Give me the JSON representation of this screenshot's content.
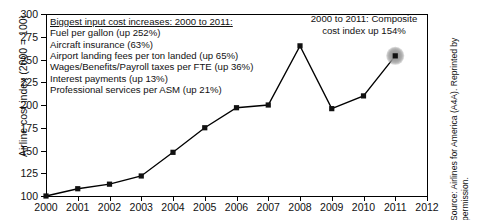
{
  "chart_data": {
    "type": "line",
    "title": "",
    "xlabel": "",
    "ylabel": "Airline cost index (2000 = 100)",
    "x": [
      2000,
      2001,
      2002,
      2003,
      2004,
      2005,
      2006,
      2007,
      2008,
      2009,
      2010,
      2011
    ],
    "values": [
      100,
      108,
      113,
      122,
      148,
      175,
      197,
      200,
      265,
      196,
      210,
      254
    ],
    "series": [
      {
        "name": "Airline cost index",
        "values": [
          100,
          108,
          113,
          122,
          148,
          175,
          197,
          200,
          265,
          196,
          210,
          254
        ]
      }
    ],
    "xlim": [
      2000,
      2012
    ],
    "ylim": [
      100,
      300
    ],
    "ytick_labels": [
      "100",
      "125",
      "150",
      "175",
      "200",
      "225",
      "250",
      "275",
      "300"
    ],
    "ytick_values": [
      100,
      125,
      150,
      175,
      200,
      225,
      250,
      275,
      300
    ],
    "xtick_labels": [
      "2000",
      "2001",
      "2002",
      "2003",
      "2004",
      "2005",
      "2006",
      "2007",
      "2008",
      "2009",
      "2010",
      "2011",
      "2012"
    ],
    "xtick_values": [
      2000,
      2001,
      2002,
      2003,
      2004,
      2005,
      2006,
      2007,
      2008,
      2009,
      2010,
      2011,
      2012
    ],
    "grid": false,
    "legend": "none",
    "marker": "square",
    "line_color": "#111111",
    "marker_color": "#111111",
    "annotations": [
      "2000 to 2011: Composite cost index up 154%",
      "Biggest input cost increases: 2000 to 2011:"
    ]
  },
  "callout": {
    "heading": "Biggest input cost increases: 2000 to 2011:",
    "items": [
      "Fuel per gallon (up 252%)",
      "Aircraft insurance (63%)",
      "Airport landing fees per ton landed (up 65%)",
      "Wages/Benefits/Payroll taxes per FTE (up 36%)",
      "Interest payments (up 13%)",
      "Professional services per ASM (up 21%)"
    ]
  },
  "annotation": {
    "line1": "2000 to 2011: Composite",
    "line2": "cost index up 154%"
  },
  "source": {
    "text": "Source: Airlines for America (A4A). Reprinted by permission."
  },
  "colors": {
    "line": "#111111",
    "axis": "#000000",
    "text": "#111111",
    "background": "#ffffff"
  }
}
